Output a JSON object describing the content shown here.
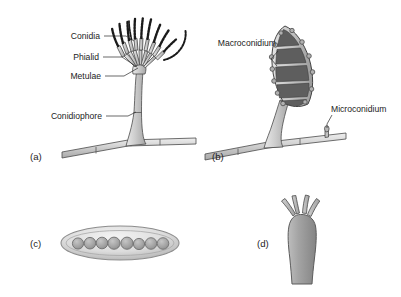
{
  "figure": {
    "background_color": "#ffffff",
    "width": 401,
    "height": 297
  },
  "palette": {
    "hypha_fill": "#c9c9c9",
    "hypha_stroke": "#4a4a4a",
    "conidiophore_fill": "#c4c4c4",
    "macroconidium_wall": "#bdbdbd",
    "macroconidium_cell": "#5e5e5e",
    "ascus_wall": "#d8d8d8",
    "ascospore_fill": "#9e9e9e",
    "basidium_fill": "#9c9c9c",
    "sterigma_fill": "#b5b5b5",
    "conidia_chain": "#1a1a1a",
    "text_color": "#1c1c1c",
    "leader_line": "#2a2a2a"
  },
  "panels": [
    {
      "id": "a",
      "letter": "(a)",
      "name": "conidiophore-panel",
      "description": "Penicillium-type conidiophore bearing brush-like conidial head on a septate hypha",
      "labels": [
        {
          "id": "conidia",
          "text": "Conidia"
        },
        {
          "id": "phialid",
          "text": "Phialid"
        },
        {
          "id": "metulae",
          "text": "Metulae"
        },
        {
          "id": "conidiophore",
          "text": "Conidiophore"
        }
      ],
      "structure": {
        "conidial_chains": 11,
        "metulae_count": 7,
        "phialid_count": 9,
        "hypha_septa": 3
      }
    },
    {
      "id": "b",
      "letter": "(b)",
      "name": "macroconidium-panel",
      "description": "Spindle-shaped multiseptate macroconidium on a stalk, with a small microconidium on the hypha",
      "labels": [
        {
          "id": "macroconidium",
          "text": "Macroconidium"
        },
        {
          "id": "microconidium",
          "text": "Microconidium"
        }
      ],
      "structure": {
        "macroconidium_cells": 5,
        "macroconidium_bumps": 12,
        "hypha_septa": 3
      }
    },
    {
      "id": "c",
      "letter": "(c)",
      "name": "ascus-panel",
      "description": "Elongate ascus containing a linear row of eight ascospores",
      "labels": [],
      "structure": {
        "ascospore_count": 8
      }
    },
    {
      "id": "d",
      "letter": "(d)",
      "name": "basidium-panel",
      "description": "Club-shaped basidium bearing four sterigmata at its apex",
      "labels": [],
      "structure": {
        "sterigmata_count": 4
      }
    }
  ]
}
